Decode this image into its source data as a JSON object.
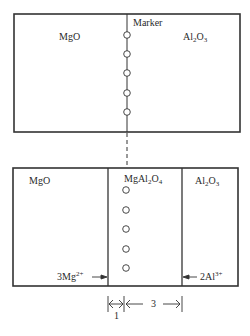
{
  "diagram": {
    "top_panel": {
      "left_label": "MgO",
      "right_label_base": "Al",
      "right_label_sub1": "2",
      "right_label_mid": "O",
      "right_label_sub2": "3",
      "marker_label": "Marker",
      "marker_count": 5
    },
    "bottom_panel": {
      "left_label": "MgO",
      "middle_label_base": "MgAl",
      "middle_label_sub1": "2",
      "middle_label_mid": "O",
      "middle_label_sub2": "4",
      "right_label_base": "Al",
      "right_label_sub1": "2",
      "right_label_mid": "O",
      "right_label_sub2": "3",
      "left_flux_coef": "3Mg",
      "left_flux_charge": "2+",
      "right_flux_coef": "2Al",
      "right_flux_charge": "3+",
      "marker_count": 5
    },
    "dimensions": {
      "left_ratio": "1",
      "right_ratio": "3"
    },
    "colors": {
      "line": "#333333",
      "background": "#ffffff"
    }
  }
}
